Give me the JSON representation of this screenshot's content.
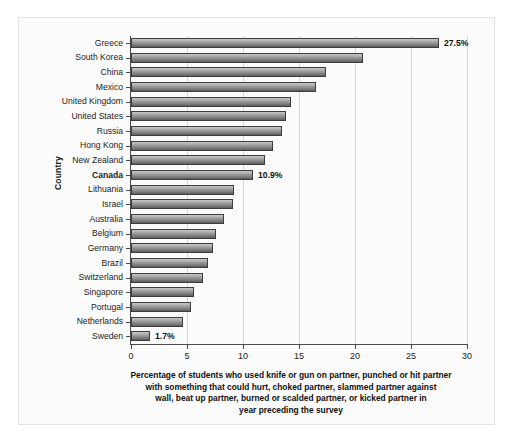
{
  "chart_data": {
    "type": "bar",
    "orientation": "horizontal",
    "title": "",
    "xlabel": "Percentage of students who used knife or gun on partner, punched or hit partner with something that could hurt, choked partner, slammed partner against wall, beat up partner, burned or scalded partner, or kicked partner in year preceding the survey",
    "ylabel": "Country",
    "xlim": [
      0,
      30
    ],
    "xticks": [
      0,
      5,
      10,
      15,
      20,
      25,
      30
    ],
    "grid": true,
    "legend": null,
    "categories": [
      "Greece",
      "South Korea",
      "China",
      "Mexico",
      "United Kingdom",
      "United States",
      "Russia",
      "Hong Kong",
      "New Zealand",
      "Canada",
      "Lithuania",
      "Israel",
      "Australia",
      "Belgium",
      "Germany",
      "Brazil",
      "Switzerland",
      "Singapore",
      "Portugal",
      "Netherlands",
      "Sweden"
    ],
    "values": [
      27.5,
      20.7,
      17.4,
      16.5,
      14.3,
      13.8,
      13.5,
      12.7,
      12.0,
      10.9,
      9.2,
      9.1,
      8.3,
      7.6,
      7.3,
      6.9,
      6.4,
      5.6,
      5.4,
      4.6,
      1.7
    ],
    "data_labels": {
      "Greece": "27.5%",
      "Canada": "10.9%",
      "Sweden": "1.7%"
    },
    "highlighted_category": "Canada"
  },
  "axis": {
    "y_title": "Country",
    "x_tick_labels": [
      "0",
      "5",
      "10",
      "15",
      "20",
      "25",
      "30"
    ]
  },
  "caption": {
    "line1": "Percentage of students who used knife or gun on partner, punched or hit partner",
    "line2": "with something that could hurt, choked partner, slammed partner against",
    "line3": "wall, beat up partner, burned or scalded partner, or kicked partner in",
    "line4": "year preceding the survey"
  },
  "colors": {
    "bar_light": "#c9c9c9",
    "bar_dark": "#585858",
    "bar_edge": "#3d3d3d",
    "grid": "#d6d6d6",
    "axis": "#4a4a4a",
    "background": "#fbfbfb",
    "text": "#1b1b1b"
  }
}
